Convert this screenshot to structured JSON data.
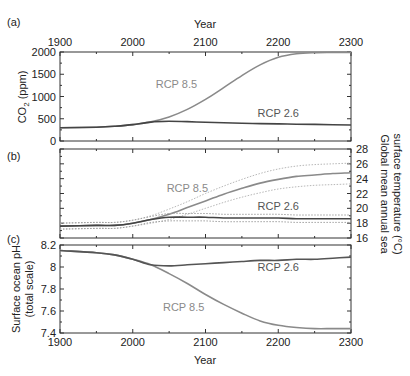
{
  "chart_data": [
    {
      "panel": "(a)",
      "type": "line",
      "title": "",
      "xlabel": "Year",
      "ylabel": "CO2 (ppm)",
      "xlim": [
        1900,
        2300
      ],
      "ylim": [
        0,
        2000
      ],
      "xticks": [
        1900,
        2000,
        2100,
        2200,
        2300
      ],
      "yticks": [
        0,
        500,
        1000,
        1500,
        2000
      ],
      "x": [
        1900,
        1950,
        1975,
        2000,
        2025,
        2050,
        2075,
        2100,
        2125,
        2150,
        2175,
        2200,
        2225,
        2250,
        2275,
        2300
      ],
      "series": [
        {
          "name": "RCP 8.5",
          "color": "#8a8a8a",
          "values": [
            296,
            311,
            331,
            369,
            430,
            540,
            710,
            935,
            1200,
            1470,
            1710,
            1880,
            1960,
            1985,
            1990,
            1990
          ]
        },
        {
          "name": "RCP 2.6",
          "color": "#444444",
          "values": [
            296,
            311,
            331,
            369,
            425,
            442,
            435,
            421,
            410,
            400,
            392,
            385,
            378,
            372,
            365,
            360
          ]
        }
      ],
      "annotations": [
        {
          "text": "RCP 8.5",
          "x": 2060,
          "y": 1190
        },
        {
          "text": "RCP 2.6",
          "x": 2200,
          "y": 540
        }
      ]
    },
    {
      "panel": "(b)",
      "type": "line",
      "xlabel": "",
      "ylabel": "Global mean annual sea surface temperature (°C)",
      "xlim": [
        1900,
        2300
      ],
      "ylim": [
        16,
        28
      ],
      "xticks": [
        1900,
        2000,
        2100,
        2200,
        2300
      ],
      "yticks": [
        16,
        18,
        20,
        22,
        24,
        26,
        28
      ],
      "x": [
        1900,
        1950,
        1975,
        2000,
        2025,
        2050,
        2075,
        2100,
        2125,
        2150,
        2175,
        2200,
        2225,
        2250,
        2275,
        2300
      ],
      "series": [
        {
          "name": "RCP 8.5",
          "color": "#8a8a8a",
          "values": [
            17.6,
            17.7,
            17.7,
            18.0,
            18.5,
            19.2,
            20.1,
            21.0,
            21.9,
            22.7,
            23.4,
            23.9,
            24.3,
            24.5,
            24.7,
            24.8
          ]
        },
        {
          "name": "RCP 8.5 upper range",
          "color": "#b8b8b8",
          "style": "dotted",
          "values": [
            18.0,
            18.1,
            18.1,
            18.4,
            19.0,
            19.9,
            20.9,
            22.0,
            23.0,
            23.9,
            24.7,
            25.3,
            25.7,
            25.9,
            26.0,
            26.1
          ]
        },
        {
          "name": "RCP 8.5 lower range",
          "color": "#b8b8b8",
          "style": "dotted",
          "values": [
            17.2,
            17.3,
            17.3,
            17.6,
            18.0,
            18.5,
            19.2,
            20.0,
            20.8,
            21.5,
            22.1,
            22.6,
            22.9,
            23.1,
            23.2,
            23.3
          ]
        },
        {
          "name": "RCP 2.6",
          "color": "#444444",
          "values": [
            17.6,
            17.7,
            17.7,
            18.0,
            18.5,
            18.8,
            18.8,
            18.8,
            18.7,
            18.7,
            18.7,
            18.7,
            18.6,
            18.6,
            18.6,
            18.6
          ]
        },
        {
          "name": "RCP 2.6 upper range",
          "color": "#a0a0a0",
          "style": "dotted",
          "values": [
            18.0,
            18.1,
            18.1,
            18.4,
            18.9,
            19.3,
            19.3,
            19.3,
            19.2,
            19.2,
            19.2,
            19.2,
            19.1,
            19.1,
            19.1,
            19.1
          ]
        },
        {
          "name": "RCP 2.6 lower range",
          "color": "#a0a0a0",
          "style": "dotted",
          "values": [
            17.2,
            17.3,
            17.3,
            17.6,
            18.1,
            18.3,
            18.3,
            18.3,
            18.2,
            18.2,
            18.2,
            18.2,
            18.1,
            18.1,
            18.1,
            18.1
          ]
        }
      ],
      "annotations": [
        {
          "text": "RCP 8.5",
          "x": 2075,
          "y": 22.2
        },
        {
          "text": "RCP 2.6",
          "x": 2200,
          "y": 19.8
        }
      ]
    },
    {
      "panel": "(c)",
      "type": "line",
      "xlabel": "Year",
      "ylabel": "Surface ocean pH (total scale)",
      "xlim": [
        1900,
        2300
      ],
      "ylim": [
        7.4,
        8.2
      ],
      "xticks": [
        1900,
        2000,
        2100,
        2200,
        2300
      ],
      "yticks": [
        7.4,
        7.6,
        7.8,
        8.0,
        8.2
      ],
      "x": [
        1900,
        1950,
        1975,
        2000,
        2025,
        2050,
        2075,
        2100,
        2125,
        2150,
        2175,
        2200,
        2225,
        2250,
        2275,
        2300
      ],
      "series": [
        {
          "name": "RCP 8.5",
          "color": "#8a8a8a",
          "values": [
            8.15,
            8.13,
            8.11,
            8.07,
            8.02,
            7.94,
            7.85,
            7.75,
            7.66,
            7.58,
            7.51,
            7.47,
            7.45,
            7.44,
            7.44,
            7.44
          ]
        },
        {
          "name": "RCP 2.6",
          "color": "#555555",
          "values": [
            8.15,
            8.13,
            8.11,
            8.07,
            8.02,
            8.01,
            8.02,
            8.03,
            8.04,
            8.05,
            8.06,
            8.06,
            8.07,
            8.07,
            8.08,
            8.09
          ]
        }
      ],
      "annotations": [
        {
          "text": "RCP 2.6",
          "x": 2200,
          "y": 7.96
        },
        {
          "text": "RCP 8.5",
          "x": 2070,
          "y": 7.6
        }
      ]
    }
  ],
  "labels": {
    "panel_a": "(a)",
    "panel_b": "(b)",
    "panel_c": "(c)",
    "top_xlabel": "Year",
    "bottom_xlabel": "Year",
    "ylabel_a_main": "CO",
    "ylabel_a_sub": "2",
    "ylabel_a_unit": " (ppm)",
    "ylabel_b_line1": "Global mean annual sea",
    "ylabel_b_line2": "surface temperature (°C)",
    "ylabel_c_line1": "Surface ocean pH",
    "ylabel_c_line2": "(total scale)"
  }
}
